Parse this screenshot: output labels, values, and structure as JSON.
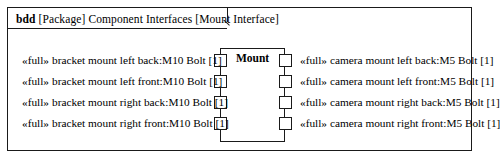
{
  "frame": {
    "kind": "bdd",
    "package_token": "[Package]",
    "model_name": "Component Interfaces",
    "diagram_name": "[Mount Interface]"
  },
  "block": {
    "name": "Mount"
  },
  "ports": {
    "left": [
      {
        "stereotype": "«full»",
        "label": "bracket mount left back:M10 Bolt [1]"
      },
      {
        "stereotype": "«full»",
        "label": "bracket mount left front:M10 Bolt [1]"
      },
      {
        "stereotype": "«full»",
        "label": "bracket mount right back:M10 Bolt [1]"
      },
      {
        "stereotype": "«full»",
        "label": "bracket mount right front:M10 Bolt [1]"
      }
    ],
    "right": [
      {
        "stereotype": "«full»",
        "label": "camera mount left back:M5 Bolt [1]"
      },
      {
        "stereotype": "«full»",
        "label": "camera mount left front:M5 Bolt [1]"
      },
      {
        "stereotype": "«full»",
        "label": "camera mount right back:M5 Bolt [1]"
      },
      {
        "stereotype": "«full»",
        "label": "camera mount right front:M5 Bolt [1]"
      }
    ]
  },
  "colors": {
    "line": "#1a1a1a",
    "background": "#ffffff",
    "text": "#000000"
  }
}
